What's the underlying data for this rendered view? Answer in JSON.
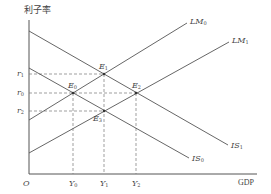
{
  "diagram": {
    "type": "IS-LM",
    "y_axis_label": "利子率",
    "x_axis_label": "GDP",
    "origin_label": "O",
    "curves": [
      {
        "id": "LM0",
        "name": "LM",
        "sub": "0"
      },
      {
        "id": "LM1",
        "name": "LM",
        "sub": "1"
      },
      {
        "id": "IS0",
        "name": "IS",
        "sub": "0"
      },
      {
        "id": "IS1",
        "name": "IS",
        "sub": "1"
      }
    ],
    "points": [
      {
        "name": "E",
        "sub": "0"
      },
      {
        "name": "E",
        "sub": "1"
      },
      {
        "name": "E",
        "sub": "2"
      },
      {
        "name": "E",
        "sub": "3"
      }
    ],
    "y_ticks": [
      {
        "name": "r",
        "sub": "1"
      },
      {
        "name": "r",
        "sub": "0"
      },
      {
        "name": "r",
        "sub": "2"
      }
    ],
    "x_ticks": [
      {
        "name": "Y",
        "sub": "0"
      },
      {
        "name": "Y",
        "sub": "1"
      },
      {
        "name": "Y",
        "sub": "2"
      }
    ],
    "colors": {
      "line": "#555555",
      "dash": "#777777",
      "text": "#444444"
    }
  }
}
